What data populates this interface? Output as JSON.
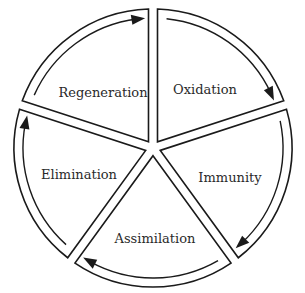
{
  "diagram": {
    "type": "cycle",
    "segments": [
      {
        "label": "Oxidation",
        "order": 1
      },
      {
        "label": "Immunity",
        "order": 2
      },
      {
        "label": "Assimilation",
        "order": 3
      },
      {
        "label": "Elimination",
        "order": 4
      },
      {
        "label": "Regeneration",
        "order": 5
      }
    ],
    "direction": "clockwise",
    "colors": {
      "stroke": "#1a1a1a",
      "text": "#2a2a2a",
      "background": "#ffffff"
    }
  }
}
